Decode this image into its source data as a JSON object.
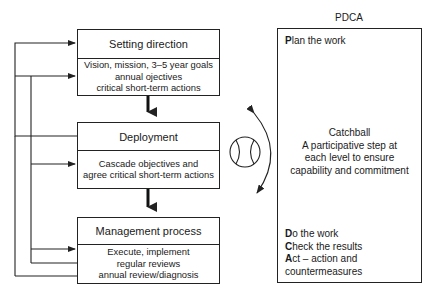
{
  "flow": {
    "steps": [
      {
        "title": "Setting direction",
        "lines": [
          "Vision, mission, 3–5 year goals",
          "annual ojectives",
          "critical short-term actions"
        ]
      },
      {
        "title": "Deployment",
        "lines": [
          "Cascade objectives and",
          "agree critical short-term actions"
        ]
      },
      {
        "title": "Management process",
        "lines": [
          "Execute, implement",
          "regular reviews",
          "annual review/diagnosis"
        ]
      }
    ]
  },
  "pdca": {
    "title": "PDCA",
    "plan": {
      "initial": "P",
      "rest": "lan the work"
    },
    "catchball": {
      "title": "Catchball",
      "lines": [
        "A participative step at",
        "each level to ensure",
        "capability and commitment"
      ]
    },
    "do": {
      "initial": "D",
      "rest": "o the work"
    },
    "check": {
      "initial": "C",
      "rest": "heck the results"
    },
    "act": {
      "initial": "A",
      "rest": "ct – action and"
    },
    "act_cont": "countermeasures"
  },
  "icons": {
    "ball": "baseball-icon",
    "cycle_arrow": "curved-double-arrow-icon"
  },
  "colors": {
    "line": "#222222",
    "background": "#ffffff"
  }
}
